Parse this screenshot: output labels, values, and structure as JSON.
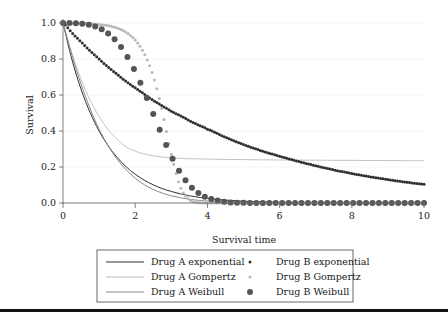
{
  "figure": {
    "background": "#ffffff",
    "width": 448,
    "height": 317,
    "bottom_rule_color": "#141414"
  },
  "axes": {
    "x_title": "Survival time",
    "y_title": "Survival",
    "x_ticks": [
      "0",
      "2",
      "4",
      "6",
      "8",
      "10"
    ],
    "y_ticks": [
      "0.0",
      "0.2",
      "0.4",
      "0.6",
      "0.8",
      "1.0"
    ]
  },
  "legend": {
    "border_color": "#585858",
    "entries": [
      {
        "label": "Drug A exponential",
        "style": "line",
        "color": "#303030",
        "marker_size": 0,
        "column": 0,
        "row": 0
      },
      {
        "label": "Drug A Gompertz",
        "style": "line",
        "color": "#b8b8b8",
        "marker_size": 0,
        "column": 0,
        "row": 1
      },
      {
        "label": "Drug A Weibull",
        "style": "line",
        "color": "#8a8a8a",
        "marker_size": 0,
        "column": 0,
        "row": 2
      },
      {
        "label": "Drug B exponential",
        "style": "dots",
        "color": "#303030",
        "marker_size": 1.5,
        "column": 1,
        "row": 0
      },
      {
        "label": "Drug B Gompertz",
        "style": "dots",
        "color": "#b8b8b8",
        "marker_size": 1.5,
        "column": 1,
        "row": 1
      },
      {
        "label": "Drug B Weibull",
        "style": "dots",
        "color": "#555555",
        "marker_size": 3.0,
        "column": 1,
        "row": 2
      }
    ]
  },
  "chart_data": {
    "type": "line",
    "title": "",
    "xlabel": "Survival time",
    "ylabel": "Survival",
    "xlim": [
      0,
      10
    ],
    "ylim": [
      0,
      1.0
    ],
    "xticks": [
      0,
      2,
      4,
      6,
      8,
      10
    ],
    "yticks": [
      0.0,
      0.2,
      0.4,
      0.6,
      0.8,
      1.0
    ],
    "grid": "horizontal-faint",
    "legend_position": "below-plot",
    "x": [
      0,
      0.25,
      0.5,
      0.75,
      1.0,
      1.25,
      1.5,
      1.75,
      2.0,
      2.25,
      2.5,
      2.75,
      3.0,
      3.25,
      3.5,
      3.75,
      4.0,
      4.5,
      5.0,
      5.5,
      6.0,
      6.5,
      7.0,
      7.5,
      8.0,
      8.5,
      9.0,
      9.5,
      10.0
    ],
    "series": [
      {
        "name": "Drug A exponential",
        "style": "line",
        "color": "#303030",
        "values": [
          1.0,
          0.795,
          0.632,
          0.503,
          0.4,
          0.318,
          0.253,
          0.201,
          0.16,
          0.127,
          0.101,
          0.08,
          0.064,
          0.051,
          0.04,
          0.032,
          0.026,
          0.016,
          0.01,
          0.0065,
          0.004,
          0.0026,
          0.0016,
          0.001,
          0.0007,
          0.0004,
          0.0003,
          0.0002,
          0.0001
        ]
      },
      {
        "name": "Drug A Gompertz",
        "style": "line",
        "color": "#b8b8b8",
        "values": [
          1.0,
          0.83,
          0.688,
          0.572,
          0.48,
          0.408,
          0.353,
          0.312,
          0.288,
          0.272,
          0.262,
          0.255,
          0.251,
          0.248,
          0.246,
          0.245,
          0.244,
          0.242,
          0.241,
          0.24,
          0.239,
          0.238,
          0.238,
          0.237,
          0.237,
          0.236,
          0.236,
          0.235,
          0.235
        ]
      },
      {
        "name": "Drug A Weibull",
        "style": "line",
        "color": "#8a8a8a",
        "values": [
          1.0,
          0.82,
          0.66,
          0.525,
          0.41,
          0.318,
          0.243,
          0.184,
          0.138,
          0.102,
          0.075,
          0.055,
          0.04,
          0.029,
          0.021,
          0.015,
          0.011,
          0.0055,
          0.003,
          0.0016,
          0.0009,
          0.0005,
          0.0003,
          0.0002,
          0.0001,
          0.0001,
          0.0,
          0.0,
          0.0
        ]
      },
      {
        "name": "Drug B exponential",
        "style": "dots",
        "color": "#303030",
        "marker_size": 1.5,
        "values": [
          1.0,
          0.945,
          0.895,
          0.845,
          0.8,
          0.755,
          0.715,
          0.675,
          0.64,
          0.605,
          0.57,
          0.54,
          0.51,
          0.485,
          0.458,
          0.433,
          0.41,
          0.365,
          0.325,
          0.29,
          0.26,
          0.232,
          0.207,
          0.184,
          0.164,
          0.146,
          0.13,
          0.116,
          0.104
        ]
      },
      {
        "name": "Drug B Gompertz",
        "style": "dots",
        "color": "#b8b8b8",
        "marker_size": 1.5,
        "values": [
          1.0,
          0.999,
          0.998,
          0.996,
          0.992,
          0.985,
          0.972,
          0.948,
          0.905,
          0.83,
          0.705,
          0.51,
          0.27,
          0.09,
          0.018,
          0.002,
          0.0002,
          0.0,
          0.0,
          0.0,
          0.0,
          0.0,
          0.0,
          0.0,
          0.0,
          0.0,
          0.0,
          0.0,
          0.0
        ]
      },
      {
        "name": "Drug B Weibull",
        "style": "dots",
        "color": "#555555",
        "marker_size": 3.0,
        "values": [
          1.0,
          0.999,
          0.996,
          0.988,
          0.972,
          0.942,
          0.894,
          0.823,
          0.73,
          0.618,
          0.495,
          0.372,
          0.26,
          0.168,
          0.1,
          0.055,
          0.028,
          0.006,
          0.0011,
          0.0002,
          0.0,
          0.0,
          0.0,
          0.0,
          0.0,
          0.0,
          0.0,
          0.0,
          0.0
        ]
      }
    ],
    "annotations": [
      {
        "text": "Drug A Gompertz plateaus near 0.235 after t=4"
      },
      {
        "text": "Drug B exponential decays slowly, ~0.10 at t=10"
      },
      {
        "text": "Drug B Weibull and Gompertz show sigmoid drop to 0 before t=4"
      }
    ]
  }
}
